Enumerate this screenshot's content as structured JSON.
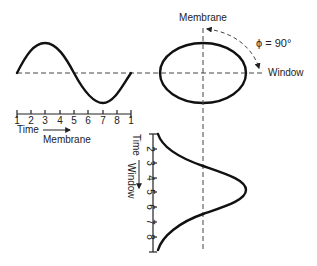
{
  "labels": {
    "membrane_top": "Membrane",
    "membrane_bottom": "Membrane",
    "window_right": "Window",
    "window_vertical": "Window",
    "phase": "ϕ = 90°",
    "time_horizontal": "Time",
    "time_vertical": "Time"
  },
  "horizontal_axis": {
    "ticks": [
      "1",
      "2",
      "3",
      "4",
      "5",
      "6",
      "7",
      "8",
      "1"
    ]
  },
  "vertical_axis": {
    "ticks": [
      "2",
      "3",
      "4",
      "5",
      "6",
      "7",
      "8"
    ]
  },
  "phase_angle_deg": 90
}
